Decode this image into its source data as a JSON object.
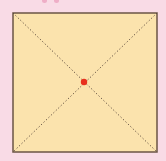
{
  "diagram": {
    "type": "square-with-diagonals",
    "square": {
      "x": 13,
      "y": 13,
      "width": 144,
      "height": 139,
      "fill": "#fbe3ad",
      "stroke": "#6b5546"
    },
    "diagonals": {
      "style": "dotted",
      "color": "#5c4a3c"
    },
    "center_point": {
      "x": 84,
      "y": 82,
      "r": 3.2,
      "color": "#e8301e"
    },
    "background": "#f9dbe6"
  }
}
